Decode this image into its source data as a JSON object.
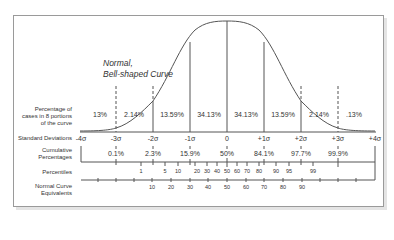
{
  "title": {
    "line1": "Normal,",
    "line2": "Bell-shaped Curve"
  },
  "row_labels": {
    "percentage_cases_1": "Percentage of",
    "percentage_cases_2": "cases in 8 portions",
    "percentage_cases_3": "of the curve",
    "standard_deviations": "Standard Deviations",
    "cumulative_1": "Cumulative",
    "cumulative_2": "Percentages",
    "percentiles": "Percentiles",
    "nce_1": "Normal Curve",
    "nce_2": "Equivalents"
  },
  "portions": [
    "13%",
    "2.14%",
    "13.59%",
    "34.13%",
    "34.13%",
    "13.59%",
    "2.14%",
    ".13%"
  ],
  "sigmas": [
    "-4σ",
    "-3σ",
    "-2σ",
    "-1σ",
    "0",
    "+1σ",
    "+2σ",
    "+3σ",
    "+4σ"
  ],
  "cumulative": [
    "0.1%",
    "2.3%",
    "15.9%",
    "50%",
    "84.1%",
    "97.7%",
    "99.9%"
  ],
  "percentiles": [
    "1",
    "5",
    "10",
    "20",
    "30",
    "40",
    "50",
    "60",
    "70",
    "80",
    "90",
    "95",
    "99"
  ],
  "nce": [
    "10",
    "20",
    "30",
    "40",
    "50",
    "60",
    "70",
    "80",
    "90"
  ],
  "colors": {
    "line": "#555555",
    "frame": "#9a9a9a",
    "text": "#333333"
  }
}
